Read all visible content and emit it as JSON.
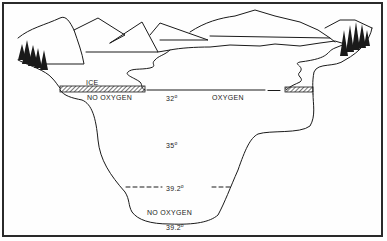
{
  "diagram": {
    "labels": {
      "ice": "ICE",
      "no_oxygen_top": "NO OXYGEN",
      "surface_temp": "32",
      "oxygen": "OXYGEN",
      "mid_temp": "35",
      "thermo_temp": "39.2",
      "no_oxygen_bottom": "NO OXYGEN",
      "bottom_temp": "39.2",
      "degree_symbol": "o"
    },
    "colors": {
      "line": "#1a1a1a",
      "background": "#ffffff",
      "border": "#2a2a2a"
    }
  }
}
